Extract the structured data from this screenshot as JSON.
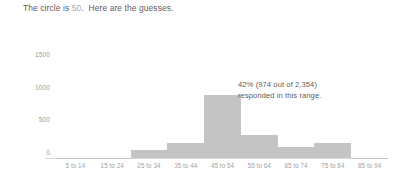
{
  "title": {
    "prefix": "The circle is ",
    "highlight": "50",
    "suffix": ".  Here are the guesses."
  },
  "annotation": {
    "line1": "42% (974 out of 2,354)",
    "line2": "responded in this range."
  },
  "colors": {
    "bar_fill": "#c4c4c4",
    "axis_line": "#d8d8d8",
    "tick_text": "#9b9b9d",
    "body_text": "#5d5d5f",
    "highlight_text": "#a9a9ab",
    "background": "#ffffff"
  },
  "chart_data": {
    "type": "bar",
    "title": "The circle is 50.  Here are the guesses.",
    "subtitle": "",
    "xlabel": "",
    "ylabel": "",
    "categories": [
      "5 to 14",
      "15 to 24",
      "25 to 34",
      "35 to 44",
      "45 to 54",
      "55 to 64",
      "65 to 74",
      "75 to 84",
      "85 to 94"
    ],
    "values": [
      4,
      6,
      130,
      225,
      974,
      350,
      170,
      225,
      5
    ],
    "ylim": [
      0,
      1750
    ],
    "yticks": [
      0,
      500,
      1000,
      1500
    ],
    "ytick_labels": [
      "0",
      "500",
      "1000",
      "1500"
    ],
    "grid": false,
    "legend": "none",
    "annotations": [
      {
        "text": "42% (974 out of 2,354) responded in this range.",
        "category": "45 to 54",
        "value": 974,
        "percent": 42,
        "count": 974,
        "total": 2354
      }
    ]
  }
}
